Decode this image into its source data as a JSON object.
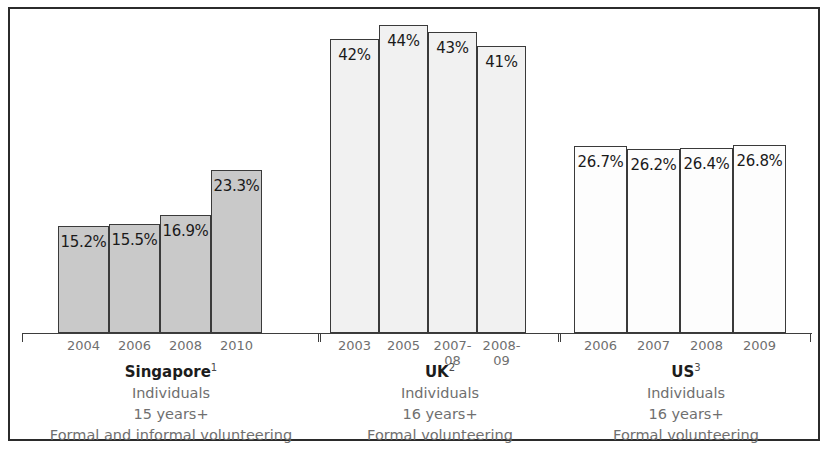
{
  "chart_data": {
    "type": "bar",
    "title": "",
    "subtitle": "",
    "xlabel": "",
    "ylabel": "",
    "grid": false,
    "legend": "none",
    "ylim": [
      0,
      50
    ],
    "groups": [
      {
        "name": "Singapore",
        "footnote": "1",
        "fill": "#c9c9c9",
        "caption_lines": [
          "Individuals",
          "15 years+",
          "Formal and informal volunteering"
        ],
        "categories": [
          "2004",
          "2006",
          "2008",
          "2010"
        ],
        "values": [
          15.2,
          15.5,
          16.9,
          23.3
        ],
        "labels": [
          "15.2%",
          "15.5%",
          "16.9%",
          "23.3%"
        ]
      },
      {
        "name": "UK",
        "footnote": "2",
        "fill": "#f1f1f1",
        "caption_lines": [
          "Individuals",
          "16 years+",
          "Formal volunteering"
        ],
        "categories": [
          "2003",
          "2005",
          "2007-08",
          "2008-09"
        ],
        "values": [
          42,
          44,
          43,
          41
        ],
        "labels": [
          "42%",
          "44%",
          "43%",
          "41%"
        ]
      },
      {
        "name": "US",
        "footnote": "3",
        "fill": "#fdfdfd",
        "caption_lines": [
          "Individuals",
          "16 years+",
          "Formal volunteering"
        ],
        "categories": [
          "2006",
          "2007",
          "2008",
          "2009"
        ],
        "values": [
          26.7,
          26.2,
          26.4,
          26.8
        ],
        "labels": [
          "26.7%",
          "26.2%",
          "26.4%",
          "26.8%"
        ]
      }
    ]
  }
}
